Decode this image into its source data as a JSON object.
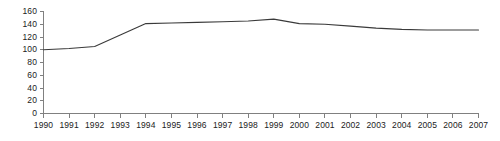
{
  "chart_data": {
    "type": "line",
    "title": "",
    "subtitle": "",
    "xlabel": "",
    "ylabel": "",
    "grid": false,
    "legend": false,
    "legend_position": "none",
    "line_color": "#3a3a3a",
    "axis_color": "#808080",
    "background": "#ffffff",
    "x": [
      1990,
      1991,
      1992,
      1993,
      1994,
      1995,
      1996,
      1997,
      1998,
      1999,
      2000,
      2001,
      2002,
      2003,
      2004,
      2005,
      2006,
      2007
    ],
    "categories": [
      "1990",
      "1991",
      "1992",
      "1993",
      "1994",
      "1995",
      "1996",
      "1997",
      "1998",
      "1999",
      "2000",
      "2001",
      "2002",
      "2003",
      "2004",
      "2005",
      "2006",
      "2007"
    ],
    "values": [
      100,
      102,
      105,
      123,
      141,
      142,
      143,
      144,
      145,
      148,
      141,
      140,
      137,
      134,
      132,
      131,
      131,
      131
    ],
    "series": [
      {
        "name": "index",
        "values": [
          100,
          102,
          105,
          123,
          141,
          142,
          143,
          144,
          145,
          148,
          141,
          140,
          137,
          134,
          132,
          131,
          131,
          131
        ]
      }
    ],
    "ylim": [
      0,
      160
    ],
    "xlim": [
      1990,
      2007
    ],
    "yticks": [
      0,
      20,
      40,
      60,
      80,
      100,
      120,
      140,
      160
    ],
    "ytick_labels": [
      "0",
      "20",
      "40",
      "60",
      "80",
      "100",
      "120",
      "140",
      "160"
    ],
    "xticks": [
      1990,
      1991,
      1992,
      1993,
      1994,
      1995,
      1996,
      1997,
      1998,
      1999,
      2000,
      2001,
      2002,
      2003,
      2004,
      2005,
      2006,
      2007
    ],
    "xtick_labels": [
      "1990",
      "1991",
      "1992",
      "1993",
      "1994",
      "1995",
      "1996",
      "1997",
      "1998",
      "1999",
      "2000",
      "2001",
      "2002",
      "2003",
      "2004",
      "2005",
      "2006",
      "2007"
    ]
  }
}
